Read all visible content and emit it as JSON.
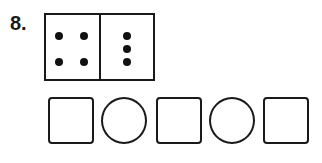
{
  "problem": {
    "number": "8.",
    "domino": {
      "left_pips": 4,
      "right_pips": 3
    },
    "answer_boxes": [
      {
        "shape": "square",
        "value": ""
      },
      {
        "shape": "circle",
        "value": ""
      },
      {
        "shape": "square",
        "value": ""
      },
      {
        "shape": "circle",
        "value": ""
      },
      {
        "shape": "square",
        "value": ""
      }
    ]
  }
}
